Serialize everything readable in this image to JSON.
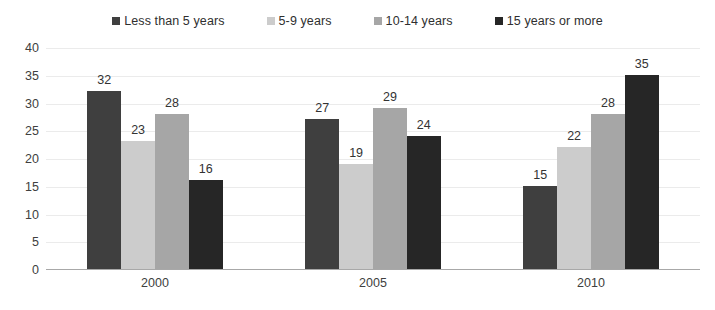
{
  "chart_data": {
    "type": "bar",
    "title": "",
    "subtitle": "",
    "xlabel": "",
    "ylabel": "",
    "categories": [
      "2000",
      "2005",
      "2010"
    ],
    "series": [
      {
        "name": "Less than 5 years",
        "color": "#3f3f3f",
        "values": [
          32,
          27,
          15
        ]
      },
      {
        "name": "5-9 years",
        "color": "#cccccc",
        "values": [
          23,
          19,
          22
        ]
      },
      {
        "name": "10-14 years",
        "color": "#a6a6a6",
        "values": [
          28,
          29,
          28
        ]
      },
      {
        "name": "15 years or more",
        "color": "#262626",
        "values": [
          16,
          24,
          35
        ]
      }
    ],
    "ylim": [
      0,
      40
    ],
    "ytick_values": [
      0,
      5,
      10,
      15,
      20,
      25,
      30,
      35,
      40
    ],
    "ytick_labels": [
      "0",
      "5",
      "10",
      "15",
      "20",
      "25",
      "30",
      "35",
      "40"
    ],
    "grid": true,
    "grid_axis": "y",
    "legend": true,
    "legend_position": "top",
    "data_labels": true,
    "background_color": "#ffffff",
    "grid_color": "#e8e8e8",
    "axis_color": "#a8a8a8",
    "text_color": "#404040"
  }
}
